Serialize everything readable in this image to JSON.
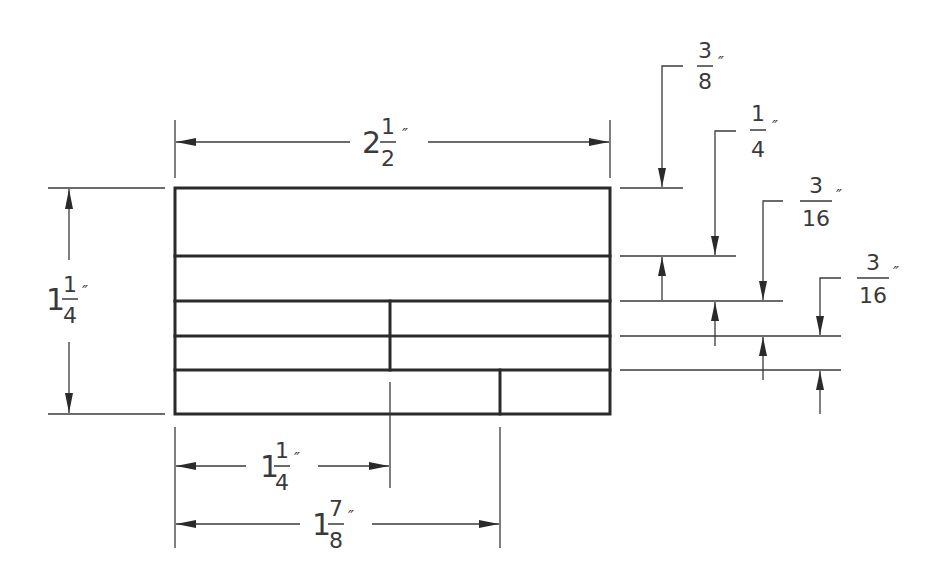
{
  "drawing": {
    "type": "dimensioned-technical-drawing",
    "units": "inches",
    "overall": {
      "width": {
        "whole": "2",
        "num": "1",
        "den": "2",
        "unit": "″",
        "value": 2.5
      },
      "height": {
        "whole": "1",
        "num": "1",
        "den": "4",
        "unit": "″",
        "value": 1.25
      }
    },
    "right_dims": [
      {
        "whole": "",
        "num": "3",
        "den": "8",
        "unit": "″",
        "value": 0.375
      },
      {
        "whole": "",
        "num": "1",
        "den": "4",
        "unit": "″",
        "value": 0.25
      },
      {
        "whole": "",
        "num": "3",
        "den": "16",
        "unit": "″",
        "value": 0.1875
      },
      {
        "whole": "",
        "num": "3",
        "den": "16",
        "unit": "″",
        "value": 0.1875
      }
    ],
    "bottom_dims": [
      {
        "whole": "1",
        "num": "1",
        "den": "4",
        "unit": "″",
        "value": 1.25
      },
      {
        "whole": "1",
        "num": "7",
        "den": "8",
        "unit": "″",
        "value": 1.875
      }
    ]
  }
}
